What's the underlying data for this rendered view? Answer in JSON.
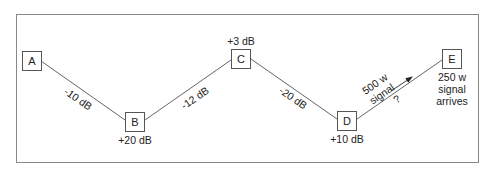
{
  "diagram": {
    "title": "",
    "nodes": [
      {
        "id": "A",
        "label": "A",
        "gain": ""
      },
      {
        "id": "B",
        "label": "B",
        "gain": "+20 dB"
      },
      {
        "id": "C",
        "label": "C",
        "gain": "+3 dB"
      },
      {
        "id": "D",
        "label": "D",
        "gain": "+10 dB"
      },
      {
        "id": "E",
        "label": "E",
        "gain": ""
      }
    ],
    "edges": [
      {
        "from": "A",
        "to": "B",
        "loss": "-10 dB"
      },
      {
        "from": "B",
        "to": "C",
        "loss": "-12 dB"
      },
      {
        "from": "C",
        "to": "D",
        "loss": "-20 dB"
      },
      {
        "from": "D",
        "to": "E",
        "loss": "?"
      }
    ],
    "signal_in": {
      "line1": "500 w",
      "line2": "signal"
    },
    "signal_out": {
      "line1": "250 w",
      "line2": "signal",
      "line3": "arrives"
    },
    "colors": {
      "stroke": "#555555",
      "text": "#222222",
      "frame": "#888888"
    }
  }
}
